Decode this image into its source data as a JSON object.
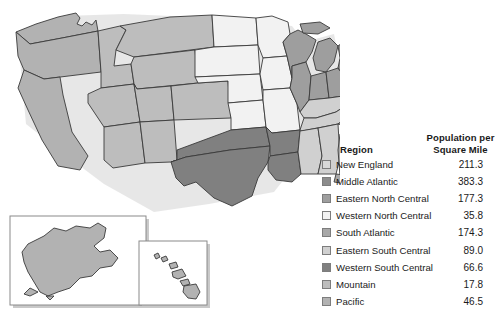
{
  "figure": {
    "type": "choropleth-map",
    "width": 495,
    "height": 313
  },
  "legend": {
    "header": {
      "region": "Region",
      "population_line1": "Population per",
      "population_line2": "Square Mile"
    },
    "rows": [
      {
        "label": "New England",
        "value": "211.3",
        "color": "#d9d9d9"
      },
      {
        "label": "Middle Atlantic",
        "value": "383.3",
        "color": "#8c8c8c"
      },
      {
        "label": "Eastern North Central",
        "value": "177.3",
        "color": "#9e9e9e"
      },
      {
        "label": "Western North Central",
        "value": "35.8",
        "color": "#f2f2f2"
      },
      {
        "label": "South Atlantic",
        "value": "174.3",
        "color": "#a8a8a8"
      },
      {
        "label": "Eastern South Central",
        "value": "89.0",
        "color": "#d0d0d0"
      },
      {
        "label": "Western South Central",
        "value": "66.6",
        "color": "#808080"
      },
      {
        "label": "Mountain",
        "value": "17.8",
        "color": "#bdbdbd"
      },
      {
        "label": "Pacific",
        "value": "46.5",
        "color": "#b2b2b2"
      }
    ]
  },
  "chart_data": {
    "type": "map",
    "title": "",
    "value_label": "Population per Square Mile",
    "category_label": "Region",
    "categories": [
      "New England",
      "Middle Atlantic",
      "Eastern North Central",
      "Western North Central",
      "South Atlantic",
      "Eastern South Central",
      "Western South Central",
      "Mountain",
      "Pacific"
    ],
    "values": [
      211.3,
      383.3,
      177.3,
      35.8,
      174.3,
      89.0,
      66.6,
      17.8,
      46.5
    ],
    "colors": [
      "#d9d9d9",
      "#8c8c8c",
      "#9e9e9e",
      "#f2f2f2",
      "#a8a8a8",
      "#d0d0d0",
      "#808080",
      "#bdbdbd",
      "#b2b2b2"
    ],
    "insets": [
      "Alaska",
      "Hawaii"
    ],
    "legend_position": "right",
    "grid": false
  }
}
